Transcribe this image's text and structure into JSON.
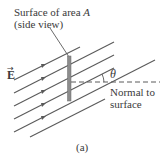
{
  "figure": {
    "surface_label_line1_prefix": "Surface of area ",
    "surface_label_line1_var": "A",
    "surface_label_line2": "(side view)",
    "field_symbol": "E",
    "field_vector_marker": "→",
    "angle_symbol": "θ",
    "normal_label_line1": "Normal to",
    "normal_label_line2": "surface",
    "caption": "(a)"
  },
  "colors": {
    "line": "#5a5a5a",
    "surface": "#8c8c8c",
    "text": "#3a3a3a"
  },
  "field_lines": [
    {
      "x1": 14,
      "y1": 80,
      "x2": 80,
      "y2": 47
    },
    {
      "x1": 14,
      "y1": 93,
      "x2": 114,
      "y2": 42
    },
    {
      "x1": 14,
      "y1": 106,
      "x2": 114,
      "y2": 55
    },
    {
      "x1": 14,
      "y1": 119,
      "x2": 114,
      "y2": 68
    },
    {
      "x1": 14,
      "y1": 132,
      "x2": 155,
      "y2": 60
    },
    {
      "x1": 30,
      "y1": 137,
      "x2": 105,
      "y2": 99
    }
  ]
}
